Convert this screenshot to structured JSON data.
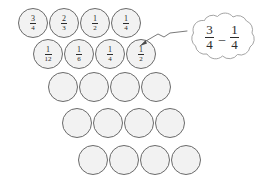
{
  "diagram": {
    "circle_fill": "#f2f2f2",
    "circle_stroke": "#6a6a6a",
    "text_color": "#2b2b2b",
    "background": "#ffffff",
    "rows": [
      {
        "name": "row-1",
        "x": 18,
        "y": 8,
        "circles": [
          {
            "label": "3/4",
            "numerator": "3",
            "denominator": "4"
          },
          {
            "label": "2/3",
            "numerator": "2",
            "denominator": "3"
          },
          {
            "label": "1/2",
            "numerator": "1",
            "denominator": "2"
          },
          {
            "label": "1/4",
            "numerator": "1",
            "denominator": "4"
          }
        ]
      },
      {
        "name": "row-2",
        "x": 33,
        "y": 39,
        "circles": [
          {
            "label": "1/12",
            "numerator": "1",
            "denominator": "12"
          },
          {
            "label": "1/6",
            "numerator": "1",
            "denominator": "6"
          },
          {
            "label": "1/4",
            "numerator": "1",
            "denominator": "4"
          },
          {
            "label": "1/2",
            "numerator": "1",
            "denominator": "2"
          }
        ]
      },
      {
        "name": "row-3",
        "x": 48,
        "y": 72,
        "circles": [
          {
            "label": "",
            "numerator": "",
            "denominator": ""
          },
          {
            "label": "",
            "numerator": "",
            "denominator": ""
          },
          {
            "label": "",
            "numerator": "",
            "denominator": ""
          },
          {
            "label": "",
            "numerator": "",
            "denominator": ""
          }
        ]
      },
      {
        "name": "row-4",
        "x": 62,
        "y": 108,
        "circles": [
          {
            "label": "",
            "numerator": "",
            "denominator": ""
          },
          {
            "label": "",
            "numerator": "",
            "denominator": ""
          },
          {
            "label": "",
            "numerator": "",
            "denominator": ""
          },
          {
            "label": "",
            "numerator": "",
            "denominator": ""
          }
        ]
      },
      {
        "name": "row-5",
        "x": 78,
        "y": 145,
        "circles": [
          {
            "label": "",
            "numerator": "",
            "denominator": ""
          },
          {
            "label": "",
            "numerator": "",
            "denominator": ""
          },
          {
            "label": "",
            "numerator": "",
            "denominator": ""
          },
          {
            "label": "",
            "numerator": "",
            "denominator": ""
          }
        ]
      }
    ],
    "bubble": {
      "name": "thought-bubble",
      "expression": "3/4 - 1/4",
      "left": {
        "numerator": "3",
        "denominator": "4"
      },
      "operator": "–",
      "right": {
        "numerator": "1",
        "denominator": "4"
      },
      "stroke": "#9a9a9a",
      "fill": "#ffffff",
      "points_to": "row-2 circle 1/2"
    },
    "pointer": {
      "name": "bubble-pointer",
      "style": "zigzag-line-with-arrowhead",
      "stroke": "#6a6a6a"
    }
  }
}
